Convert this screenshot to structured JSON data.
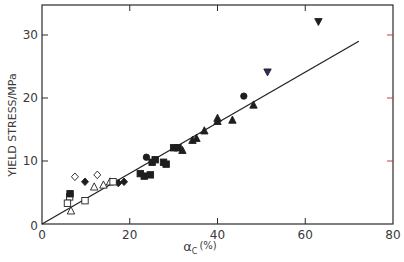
{
  "chart_data": {
    "type": "scatter",
    "title": "",
    "xlabel": "αc (%)",
    "xlabel_main": "α",
    "xlabel_sub": "C",
    "xlabel_unit": "(%)",
    "ylabel": "YIELD STRESS/MPa",
    "xlim": [
      0,
      80
    ],
    "ylim": [
      0,
      35
    ],
    "xticks": [
      0,
      20,
      40,
      60,
      80
    ],
    "yticks": [
      0,
      10,
      20,
      30
    ],
    "grid": false,
    "legend": null,
    "fit_line": {
      "x": [
        0,
        72.2
      ],
      "y": [
        0,
        29.0
      ]
    },
    "series": [
      {
        "name": "open diamond",
        "marker": "diamond-open",
        "points": [
          [
            7.5,
            7.5
          ],
          [
            12.6,
            7.8
          ]
        ]
      },
      {
        "name": "filled diamond",
        "marker": "diamond-filled",
        "points": [
          [
            9.8,
            6.7
          ],
          [
            18.7,
            6.7
          ],
          [
            17.4,
            6.5
          ]
        ]
      },
      {
        "name": "open triangle",
        "marker": "triangle-open",
        "points": [
          [
            6.6,
            2.1
          ],
          [
            11.9,
            5.9
          ],
          [
            14.0,
            6.2
          ],
          [
            15.5,
            6.7
          ]
        ]
      },
      {
        "name": "open square",
        "marker": "square-open",
        "points": [
          [
            6.3,
            4.3
          ],
          [
            5.8,
            3.3
          ],
          [
            9.8,
            3.7
          ],
          [
            16.2,
            6.7
          ]
        ]
      },
      {
        "name": "filled square",
        "marker": "square-filled",
        "points": [
          [
            6.4,
            4.8
          ],
          [
            22.4,
            8.0
          ],
          [
            23.3,
            7.6
          ],
          [
            24.7,
            7.8
          ],
          [
            25.1,
            9.8
          ],
          [
            25.8,
            10.2
          ],
          [
            27.7,
            9.8
          ],
          [
            28.3,
            9.5
          ],
          [
            30.0,
            12.1
          ],
          [
            31.0,
            12.1
          ]
        ]
      },
      {
        "name": "filled circle",
        "marker": "circle-filled",
        "points": [
          [
            23.8,
            10.6
          ],
          [
            46.0,
            20.3
          ]
        ]
      },
      {
        "name": "filled triangle",
        "marker": "triangle-filled",
        "points": [
          [
            32.0,
            11.7
          ],
          [
            34.3,
            13.3
          ],
          [
            35.2,
            13.6
          ],
          [
            37.0,
            14.8
          ],
          [
            40.0,
            16.3
          ],
          [
            40.0,
            16.8
          ],
          [
            43.4,
            16.5
          ],
          [
            48.2,
            18.9
          ]
        ]
      },
      {
        "name": "filled inverted triangle",
        "marker": "triangle-down-filled",
        "points": [
          [
            51.4,
            24.1
          ],
          [
            63.0,
            32.1
          ]
        ]
      }
    ]
  },
  "axis_labels": {
    "x": [
      "0",
      "20",
      "40",
      "60",
      "80"
    ],
    "y": [
      "0",
      "10",
      "20",
      "30"
    ],
    "origin_y": "0"
  },
  "colors": {
    "axis": "#2a2a2a",
    "marker": "#1e1e1e",
    "line": "#222222",
    "text": "#3a3a3a",
    "tick_accent": "#c04040",
    "inverted_triangle_blue": "#2a2a6a"
  }
}
